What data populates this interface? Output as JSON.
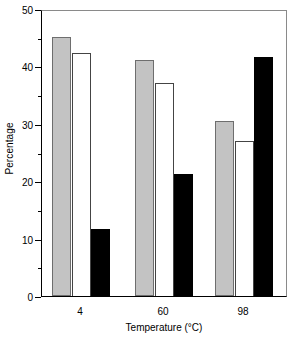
{
  "chart_data": {
    "type": "bar",
    "title": "",
    "xlabel": "Temperature (°C)",
    "ylabel": "Percentage",
    "categories": [
      "4",
      "60",
      "98"
    ],
    "series": [
      {
        "name": "gray",
        "color": "#c3c3c3",
        "values": [
          45.2,
          41.2,
          30.5
        ]
      },
      {
        "name": "white",
        "color": "#ffffff",
        "values": [
          42.4,
          37.1,
          27.0
        ]
      },
      {
        "name": "black",
        "color": "#000000",
        "values": [
          11.7,
          21.3,
          41.7
        ]
      }
    ],
    "ylim": [
      0,
      50
    ],
    "ytick_major": [
      0,
      10,
      20,
      30,
      40,
      50
    ],
    "ytick_minor": [
      5,
      15,
      25,
      35,
      45
    ],
    "ytick_labels": [
      "0",
      "10",
      "20",
      "30",
      "40",
      "50"
    ],
    "grid": false,
    "legend": "none"
  },
  "geometry": {
    "plot_left": 41,
    "plot_top": 10,
    "plot_width": 246,
    "plot_height": 287,
    "bar_width": 19,
    "group_centers": [
      80,
      163,
      243
    ],
    "series_offsets": [
      -19.5,
      0,
      19.5
    ]
  }
}
